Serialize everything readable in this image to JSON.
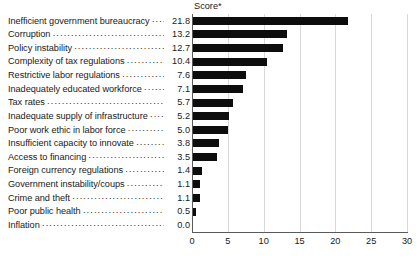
{
  "chart_data": {
    "type": "bar",
    "orientation": "horizontal",
    "title": "Score*",
    "xlabel": "",
    "ylabel": "",
    "xlim": [
      0,
      30
    ],
    "xticks": [
      "0",
      "5",
      "10",
      "15",
      "20",
      "25",
      "30"
    ],
    "grid": "vertical",
    "legend": null,
    "bar_color": "#0d0d0d",
    "gridline_color": "#d8d8d8",
    "axis_color": "#5a5a5a",
    "categories": [
      "Inefficient government bureaucracy",
      "Corruption",
      "Policy instability",
      "Complexity of tax regulations",
      "Restrictive labor regulations",
      "Inadequately educated workforce",
      "Tax rates",
      "Inadequate supply of infrastructure",
      "Poor work ethic in labor force",
      "Insufficient capacity to innovate",
      "Access to financing",
      "Foreign currency regulations",
      "Government instability/coups",
      "Crime and theft",
      "Poor public health",
      "Inflation"
    ],
    "values": [
      21.8,
      13.2,
      12.7,
      10.4,
      7.6,
      7.1,
      5.7,
      5.2,
      5.0,
      3.8,
      3.5,
      1.4,
      1.1,
      1.1,
      0.5,
      0.0
    ],
    "value_labels": [
      "21.8",
      "13.2",
      "12.7",
      "10.4",
      "7.6",
      "7.1",
      "5.7",
      "5.2",
      "5.0",
      "3.8",
      "3.5",
      "1.4",
      "1.1",
      "1.1",
      "0.5",
      "0.0"
    ]
  }
}
